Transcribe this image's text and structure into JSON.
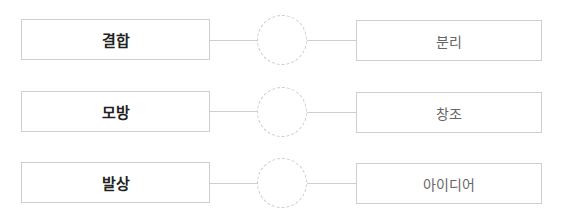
{
  "rows": [
    {
      "left": "결합",
      "right": "분리"
    },
    {
      "left": "모방",
      "right": "창조"
    },
    {
      "left": "발상",
      "right": "아이디어"
    }
  ],
  "colors": {
    "border": "#cfcfcf",
    "left_text": "#222222",
    "right_text": "#666666"
  }
}
